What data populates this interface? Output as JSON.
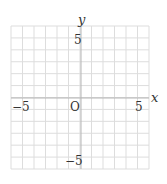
{
  "chart_data": {
    "type": "scatter",
    "title": "",
    "xlabel": "x",
    "ylabel": "y",
    "xlim": [
      -6,
      6
    ],
    "ylim": [
      -6,
      6
    ],
    "grid": true,
    "grid_step": 1,
    "x_tick_labels": [
      "-5",
      "5"
    ],
    "y_tick_labels": [
      "5",
      "-5"
    ],
    "origin_label": "O",
    "series": []
  },
  "labels": {
    "x_axis": "x",
    "y_axis": "y",
    "origin": "O",
    "x_neg": "−5",
    "x_pos": "5",
    "y_pos": "5",
    "y_neg": "−5"
  },
  "colors": {
    "grid": "#dddddd",
    "axis": "#b5b5b5",
    "text": "#333333"
  }
}
